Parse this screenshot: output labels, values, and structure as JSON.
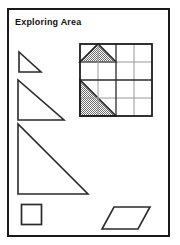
{
  "worksheet": {
    "title": "Exploring Area",
    "border_color": "#1a1a1a",
    "background_color": "#ffffff"
  },
  "colors": {
    "stroke_dark": "#222222",
    "stroke_light": "#8c8c8c",
    "shade_fill": "#9a9a9a",
    "page_background": "#ffffff"
  },
  "figures": {
    "grid": {
      "name": "area-grid",
      "columns": 4,
      "rows": 4,
      "cell_size": 18,
      "major_line_every": 2,
      "shaded_shapes": [
        {
          "name": "shaded-triangle-top",
          "type": "triangle",
          "description": "isosceles triangle, base 2 cells wide on row 1, apex at midpoint of top edge",
          "base_cells": 2,
          "height_cells": 1,
          "area_square_units": 1
        },
        {
          "name": "shaded-triangle-lower-left",
          "type": "triangle",
          "description": "right triangle occupying lower-left 2x2 block, diagonal from top-left to bottom-right",
          "base_cells": 2,
          "height_cells": 2,
          "area_square_units": 2
        }
      ]
    },
    "shapes": [
      {
        "name": "triangle-small",
        "type": "right-triangle",
        "width": 22,
        "height": 20,
        "right_angle": "bottom-left"
      },
      {
        "name": "triangle-medium",
        "type": "right-triangle",
        "width": 45,
        "height": 40,
        "right_angle": "bottom-left"
      },
      {
        "name": "triangle-large",
        "type": "right-triangle",
        "width": 70,
        "height": 70,
        "right_angle": "bottom-left"
      },
      {
        "name": "square",
        "type": "square",
        "width": 20,
        "height": 20
      },
      {
        "name": "parallelogram",
        "type": "parallelogram",
        "width": 46,
        "height": 22,
        "slant": 12
      }
    ]
  }
}
